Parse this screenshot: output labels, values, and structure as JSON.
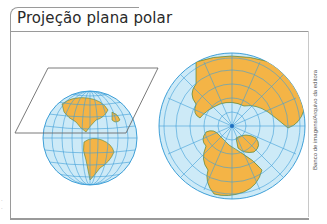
{
  "title": "Projeção plana polar",
  "credit": "Banco de imagens/Arquivo da editora",
  "diagram": {
    "left_figure": "globe-with-tangent-plane",
    "right_figure": "polar-azimuthal-projection-north-pole",
    "colors": {
      "ocean": "#cdeaf7",
      "land": "#f4b446",
      "grid": "#3fa0d8",
      "coast": "#3b7a2c",
      "plane": "#6b6b6b",
      "frame": "#9a9a9a"
    }
  }
}
